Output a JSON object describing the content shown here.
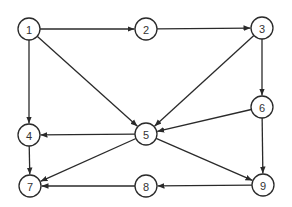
{
  "diagram": {
    "type": "directed-graph",
    "colors": {
      "stroke": "#2a2a2a",
      "node_fill": "#ffffff",
      "label": "#333333",
      "background": "#ffffff"
    },
    "node_radius": 11,
    "nodes": [
      {
        "id": "1",
        "label": "1",
        "x": 29,
        "y": 29
      },
      {
        "id": "2",
        "label": "2",
        "x": 146,
        "y": 29
      },
      {
        "id": "3",
        "label": "3",
        "x": 262,
        "y": 28
      },
      {
        "id": "4",
        "label": "4",
        "x": 29,
        "y": 135
      },
      {
        "id": "5",
        "label": "5",
        "x": 146,
        "y": 134
      },
      {
        "id": "6",
        "label": "6",
        "x": 262,
        "y": 107
      },
      {
        "id": "7",
        "label": "7",
        "x": 30,
        "y": 186
      },
      {
        "id": "8",
        "label": "8",
        "x": 146,
        "y": 186
      },
      {
        "id": "9",
        "label": "9",
        "x": 263,
        "y": 185
      }
    ],
    "edges": [
      {
        "from": "1",
        "to": "2"
      },
      {
        "from": "2",
        "to": "3"
      },
      {
        "from": "1",
        "to": "4"
      },
      {
        "from": "1",
        "to": "5"
      },
      {
        "from": "3",
        "to": "5"
      },
      {
        "from": "3",
        "to": "6"
      },
      {
        "from": "5",
        "to": "4"
      },
      {
        "from": "6",
        "to": "5"
      },
      {
        "from": "4",
        "to": "7"
      },
      {
        "from": "5",
        "to": "7"
      },
      {
        "from": "5",
        "to": "9"
      },
      {
        "from": "6",
        "to": "9"
      },
      {
        "from": "9",
        "to": "8"
      },
      {
        "from": "8",
        "to": "7"
      }
    ]
  }
}
